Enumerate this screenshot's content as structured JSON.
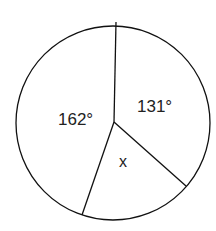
{
  "diagram": {
    "type": "circle-sectors",
    "sectors": [
      {
        "label": "162°",
        "angle_deg": 162
      },
      {
        "label": "131°",
        "angle_deg": 131
      },
      {
        "label": "x",
        "angle_deg": null
      }
    ]
  }
}
